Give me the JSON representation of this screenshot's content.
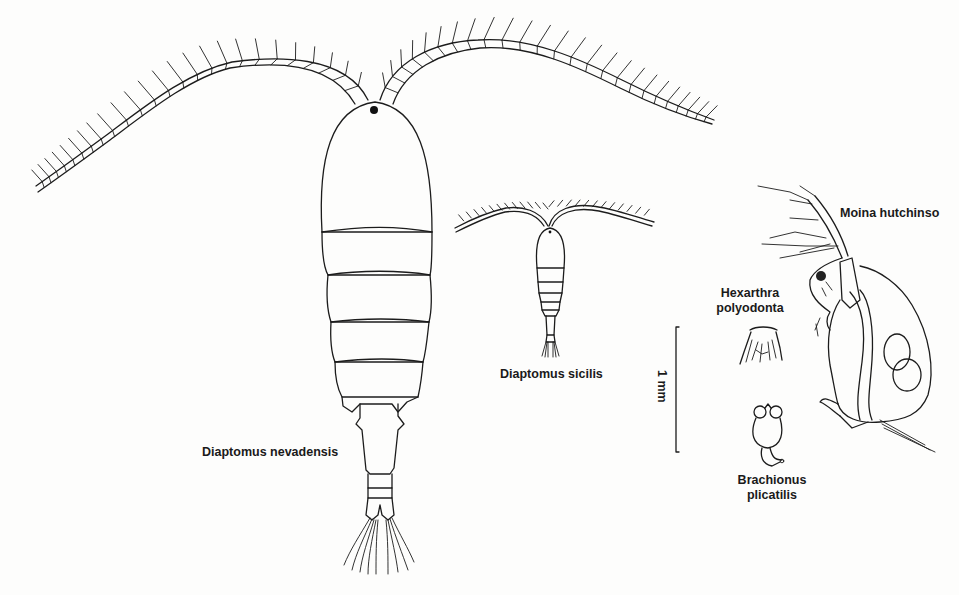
{
  "figure": {
    "specimens": [
      {
        "id": "diaptomus-nevadensis",
        "label": "Diaptomus nevadensis",
        "group": "copepod"
      },
      {
        "id": "diaptomus-sicilis",
        "label": "Diaptomus sicilis",
        "group": "copepod"
      },
      {
        "id": "hexarthra-polyodonta",
        "label_line1": "Hexarthra",
        "label_line2": "polyodonta",
        "group": "rotifer"
      },
      {
        "id": "brachionus-plicatilis",
        "label_line1": "Brachionus",
        "label_line2": "plicatilis",
        "group": "rotifer"
      },
      {
        "id": "moina-hutchinsoni",
        "label": "Moina hutchinso",
        "group": "cladoceran"
      }
    ],
    "scale_bar": {
      "label": "1 mm",
      "length_mm": 1
    },
    "colors": {
      "ink": "#1c1c1c",
      "paper": "#fdfdfc"
    }
  }
}
